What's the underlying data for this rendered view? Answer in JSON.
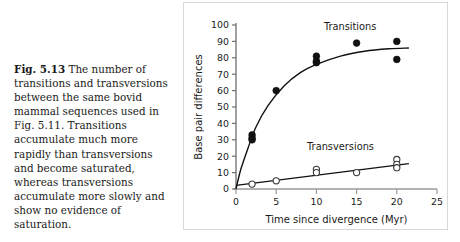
{
  "caption": {
    "fig_label": "Fig. 5.13",
    "text": "The number of transitions and transversions between the same bovid mammal sequences used in Fig. 5.11. Transitions accumulate much more rapidly than transversions and become saturated, whereas transversions accumulate more slowly and show no evidence of saturation."
  },
  "chart_data": {
    "type": "scatter",
    "title": "",
    "xlabel": "Time since divergence (Myr)",
    "ylabel": "Base pair differences",
    "xlim": [
      0,
      25
    ],
    "ylim": [
      0,
      100
    ],
    "xticks": [
      0,
      5,
      10,
      15,
      20,
      25
    ],
    "yticks": [
      0,
      10,
      20,
      30,
      40,
      50,
      60,
      70,
      80,
      90,
      100
    ],
    "grid": false,
    "legend_position": "inline-annotation",
    "series": [
      {
        "name": "Transitions",
        "marker": "filled-circle",
        "color": "#111111",
        "points": [
          {
            "x": 2,
            "y": 33
          },
          {
            "x": 2,
            "y": 31
          },
          {
            "x": 2,
            "y": 30
          },
          {
            "x": 5,
            "y": 60
          },
          {
            "x": 10,
            "y": 81
          },
          {
            "x": 10,
            "y": 78
          },
          {
            "x": 10,
            "y": 77
          },
          {
            "x": 15,
            "y": 89
          },
          {
            "x": 20,
            "y": 90
          },
          {
            "x": 20,
            "y": 79
          }
        ],
        "fit_curve": "saturating",
        "fit_points": [
          {
            "x": 0,
            "y": 0
          },
          {
            "x": 0.6,
            "y": 12
          },
          {
            "x": 1.5,
            "y": 25
          },
          {
            "x": 2.5,
            "y": 38
          },
          {
            "x": 4,
            "y": 51
          },
          {
            "x": 6,
            "y": 63
          },
          {
            "x": 8,
            "y": 71
          },
          {
            "x": 10,
            "y": 76
          },
          {
            "x": 13,
            "y": 81
          },
          {
            "x": 16,
            "y": 84
          },
          {
            "x": 19,
            "y": 85.5
          },
          {
            "x": 21.5,
            "y": 86
          }
        ],
        "annotation": "Transitions"
      },
      {
        "name": "Transversions",
        "marker": "open-circle",
        "color": "#111111",
        "points": [
          {
            "x": 2,
            "y": 3
          },
          {
            "x": 5,
            "y": 5
          },
          {
            "x": 10,
            "y": 12
          },
          {
            "x": 10,
            "y": 10
          },
          {
            "x": 15,
            "y": 10
          },
          {
            "x": 20,
            "y": 18
          },
          {
            "x": 20,
            "y": 15
          },
          {
            "x": 20,
            "y": 13
          }
        ],
        "fit_curve": "linear",
        "fit_points": [
          {
            "x": 0,
            "y": 2.2
          },
          {
            "x": 21.5,
            "y": 15.5
          }
        ],
        "annotation": "Transversions"
      }
    ],
    "annotations": [
      {
        "text": "Transitions",
        "x": 14.2,
        "y": 97
      },
      {
        "text": "Transversions",
        "x": 13.0,
        "y": 24
      }
    ]
  }
}
